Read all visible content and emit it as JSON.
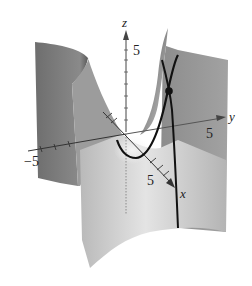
{
  "figure": {
    "type": "3d-surface-diagram",
    "axes": {
      "x": {
        "label": "x",
        "tick_label": "5"
      },
      "y": {
        "label": "y",
        "tick_label": "5",
        "neg_tick_label": "−5"
      },
      "z": {
        "label": "z",
        "tick_label": "5"
      }
    },
    "colors": {
      "surface_dark": "#7a7a7a",
      "surface_mid": "#a8a8a8",
      "surface_light": "#d6d6d6",
      "curve": "#111111",
      "axis": "#333333"
    },
    "curves": [
      {
        "name": "parabola-curve"
      },
      {
        "name": "line-curve"
      }
    ],
    "points": [
      {
        "name": "intersection-point"
      }
    ]
  }
}
